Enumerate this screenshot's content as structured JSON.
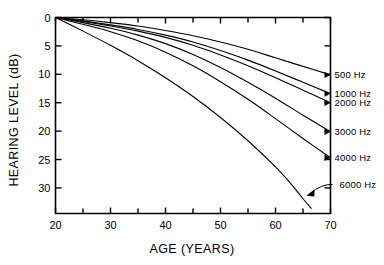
{
  "chart_data": {
    "type": "line",
    "title": "",
    "xlabel": "AGE (YEARS)",
    "ylabel": "HEARING LEVEL (dB)",
    "xlim": [
      20,
      70
    ],
    "ylim": [
      0,
      34.5
    ],
    "y_inverted": true,
    "grid": false,
    "legend_position": "right-axis-inline",
    "xticks": [
      20,
      30,
      40,
      50,
      60,
      70
    ],
    "xtick_labels": [
      "20",
      "30",
      "40",
      "50",
      "60",
      "70"
    ],
    "xminor_step": 5,
    "yticks": [
      0,
      5,
      10,
      15,
      20,
      25,
      30
    ],
    "ytick_labels": [
      "0",
      "5",
      "10",
      "15",
      "20",
      "25",
      "30"
    ],
    "series": [
      {
        "name": "500 Hz",
        "label": "500 Hz",
        "x": [
          20,
          25,
          30,
          35,
          40,
          45,
          50,
          55,
          60,
          65,
          70
        ],
        "values": [
          0,
          0.4,
          0.9,
          1.5,
          2.3,
          3.2,
          4.3,
          5.6,
          7.1,
          8.6,
          10.1
        ]
      },
      {
        "name": "1000 Hz",
        "label": "1000 Hz",
        "x": [
          20,
          25,
          30,
          35,
          40,
          45,
          50,
          55,
          60,
          65,
          70
        ],
        "values": [
          0,
          0.6,
          1.3,
          2.1,
          3.1,
          4.3,
          5.8,
          7.5,
          9.4,
          11.4,
          13.4
        ]
      },
      {
        "name": "2000 Hz",
        "label": "2000 Hz",
        "x": [
          20,
          25,
          30,
          35,
          40,
          45,
          50,
          55,
          60,
          65,
          70
        ],
        "values": [
          0,
          0.7,
          1.5,
          2.4,
          3.5,
          4.9,
          6.6,
          8.5,
          10.6,
          12.8,
          15.0
        ]
      },
      {
        "name": "3000 Hz",
        "label": "3000 Hz",
        "x": [
          20,
          25,
          30,
          35,
          40,
          45,
          50,
          55,
          60,
          65,
          70
        ],
        "values": [
          0,
          0.9,
          1.9,
          3.1,
          4.6,
          6.5,
          8.8,
          11.4,
          14.2,
          17.2,
          20.1
        ]
      },
      {
        "name": "4000 Hz",
        "label": "4000 Hz",
        "x": [
          20,
          25,
          30,
          35,
          40,
          45,
          50,
          55,
          60,
          65,
          70
        ],
        "values": [
          0,
          1.2,
          2.5,
          4.1,
          6.1,
          8.5,
          11.3,
          14.4,
          17.8,
          21.3,
          24.7
        ]
      },
      {
        "name": "6000 Hz",
        "label": "6000 Hz",
        "x": [
          20,
          25,
          30,
          35,
          40,
          45,
          50,
          55,
          60,
          63,
          65,
          66.5
        ],
        "values": [
          0,
          2.4,
          4.9,
          7.6,
          10.6,
          13.9,
          17.6,
          21.7,
          26.3,
          29.5,
          31.9,
          33.6
        ]
      }
    ]
  },
  "annotation": {
    "pointer_target_series": "6000 Hz",
    "pointer_label": "6000 Hz"
  },
  "colors": {
    "ink": "#000000",
    "background": "#ffffff"
  }
}
